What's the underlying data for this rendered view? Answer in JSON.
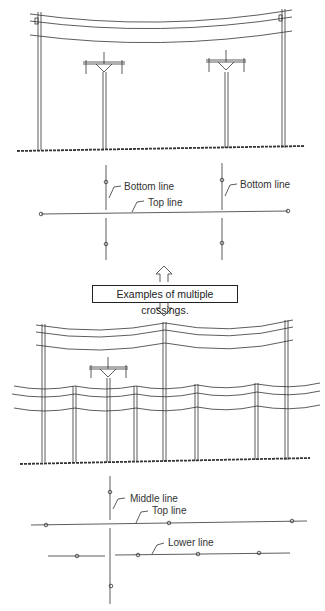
{
  "diagram": {
    "title": "Examples of multiple crossings.",
    "section1": {
      "labels": {
        "bottom_line_left": "Bottom line",
        "bottom_line_right": "Bottom line",
        "top_line": "Top line"
      }
    },
    "section2": {
      "labels": {
        "middle_line": "Middle line",
        "top_line": "Top line",
        "lower_line": "Lower line"
      }
    },
    "colors": {
      "ink": "#333333",
      "background": "#ffffff"
    }
  }
}
